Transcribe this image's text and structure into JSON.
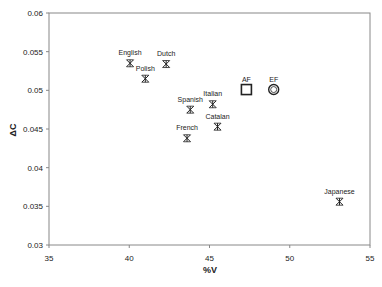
{
  "chart_data": {
    "type": "scatter",
    "title": "",
    "xlabel": "%V",
    "ylabel": "ΔC",
    "xlim": [
      35,
      55
    ],
    "ylim": [
      0.03,
      0.06
    ],
    "x_ticks": [
      "35",
      "40",
      "45",
      "50",
      "55"
    ],
    "y_ticks": [
      "0.03",
      "0.035",
      "0.04",
      "0.045",
      "0.05",
      "0.055",
      "0.06"
    ],
    "grid": false,
    "legend": "none",
    "points": [
      {
        "label": "English",
        "x": 40.05,
        "y": 0.0535,
        "marker": "asterisk"
      },
      {
        "label": "Polish",
        "x": 41.0,
        "y": 0.0515,
        "marker": "asterisk"
      },
      {
        "label": "Dutch",
        "x": 42.3,
        "y": 0.0534,
        "marker": "asterisk"
      },
      {
        "label": "Spanish",
        "x": 43.8,
        "y": 0.0475,
        "marker": "asterisk"
      },
      {
        "label": "Italian",
        "x": 45.2,
        "y": 0.0482,
        "marker": "asterisk"
      },
      {
        "label": "Catalan",
        "x": 45.5,
        "y": 0.0453,
        "marker": "asterisk"
      },
      {
        "label": "French",
        "x": 43.6,
        "y": 0.0438,
        "marker": "asterisk"
      },
      {
        "label": "AF",
        "x": 47.3,
        "y": 0.0501,
        "marker": "square"
      },
      {
        "label": "EF",
        "x": 49.0,
        "y": 0.0501,
        "marker": "circle"
      },
      {
        "label": "Japanese",
        "x": 53.1,
        "y": 0.0356,
        "marker": "asterisk"
      }
    ]
  },
  "colors": {
    "axis": "#888888",
    "marker": "#222222",
    "text": "#222222"
  }
}
